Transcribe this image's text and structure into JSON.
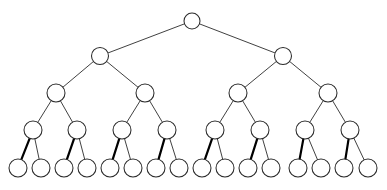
{
  "figure": {
    "type": "tree-diagram",
    "width": 387,
    "height": 190,
    "background_color": "#ffffff",
    "node_fill_color": "#ffffff",
    "node_stroke_color": "#2b2b2b",
    "edge_color": "#2b2b2b",
    "bold_edge_color": "#000000",
    "edge_width": 0.9,
    "bold_edge_width": 2.2,
    "node_stroke_width": 1.05,
    "depth": 5,
    "node_count": 31,
    "leaf_count": 16,
    "branching_factor": 2,
    "has_text_labels": false
  },
  "levels": [
    {
      "index": 0,
      "name": "root",
      "y": 21,
      "radius": 8.0,
      "count": 1
    },
    {
      "index": 1,
      "name": "level-1",
      "y": 56,
      "radius": 8.5,
      "count": 2
    },
    {
      "index": 2,
      "name": "level-2",
      "y": 93,
      "radius": 9.0,
      "count": 4
    },
    {
      "index": 3,
      "name": "level-3",
      "y": 130,
      "radius": 9.0,
      "count": 8
    },
    {
      "index": 4,
      "name": "leaves",
      "y": 168,
      "radius": 9.0,
      "count": 16
    }
  ],
  "nodes": [
    {
      "id": "n0",
      "level": 0,
      "x": 192.0,
      "y": 21,
      "r": 8.0
    },
    {
      "id": "n1",
      "level": 1,
      "x": 100.0,
      "y": 56,
      "r": 8.5
    },
    {
      "id": "n2",
      "level": 1,
      "x": 283.0,
      "y": 56,
      "r": 8.5
    },
    {
      "id": "n3",
      "level": 2,
      "x": 56.0,
      "y": 93,
      "r": 9.0
    },
    {
      "id": "n4",
      "level": 2,
      "x": 145.0,
      "y": 93,
      "r": 9.0
    },
    {
      "id": "n5",
      "level": 2,
      "x": 238.0,
      "y": 93,
      "r": 9.0
    },
    {
      "id": "n6",
      "level": 2,
      "x": 328.0,
      "y": 93,
      "r": 9.0
    },
    {
      "id": "n7",
      "level": 3,
      "x": 33.0,
      "y": 130,
      "r": 9.0
    },
    {
      "id": "n8",
      "level": 3,
      "x": 77.0,
      "y": 130,
      "r": 9.0
    },
    {
      "id": "n9",
      "level": 3,
      "x": 122.0,
      "y": 130,
      "r": 9.0
    },
    {
      "id": "n10",
      "level": 3,
      "x": 167.0,
      "y": 130,
      "r": 9.0
    },
    {
      "id": "n11",
      "level": 3,
      "x": 215.0,
      "y": 130,
      "r": 9.0
    },
    {
      "id": "n12",
      "level": 3,
      "x": 260.0,
      "y": 130,
      "r": 9.0
    },
    {
      "id": "n13",
      "level": 3,
      "x": 305.0,
      "y": 130,
      "r": 9.0
    },
    {
      "id": "n14",
      "level": 3,
      "x": 350.0,
      "y": 130,
      "r": 9.0
    },
    {
      "id": "n15",
      "level": 4,
      "x": 18.0,
      "y": 168,
      "r": 9.0
    },
    {
      "id": "n16",
      "level": 4,
      "x": 41.0,
      "y": 168,
      "r": 9.0
    },
    {
      "id": "n17",
      "level": 4,
      "x": 64.0,
      "y": 168,
      "r": 9.0
    },
    {
      "id": "n18",
      "level": 4,
      "x": 87.0,
      "y": 168,
      "r": 9.0
    },
    {
      "id": "n19",
      "level": 4,
      "x": 110.0,
      "y": 168,
      "r": 9.0
    },
    {
      "id": "n20",
      "level": 4,
      "x": 133.0,
      "y": 168,
      "r": 9.0
    },
    {
      "id": "n21",
      "level": 4,
      "x": 156.0,
      "y": 168,
      "r": 9.0
    },
    {
      "id": "n22",
      "level": 4,
      "x": 179.0,
      "y": 168,
      "r": 9.0
    },
    {
      "id": "n23",
      "level": 4,
      "x": 202.0,
      "y": 168,
      "r": 9.0
    },
    {
      "id": "n24",
      "level": 4,
      "x": 225.0,
      "y": 168,
      "r": 9.0
    },
    {
      "id": "n25",
      "level": 4,
      "x": 248.0,
      "y": 168,
      "r": 9.0
    },
    {
      "id": "n26",
      "level": 4,
      "x": 271.0,
      "y": 168,
      "r": 9.0
    },
    {
      "id": "n27",
      "level": 4,
      "x": 298.0,
      "y": 168,
      "r": 9.0
    },
    {
      "id": "n28",
      "level": 4,
      "x": 321.0,
      "y": 168,
      "r": 9.0
    },
    {
      "id": "n29",
      "level": 4,
      "x": 344.0,
      "y": 168,
      "r": 9.0
    },
    {
      "id": "n30",
      "level": 4,
      "x": 368.0,
      "y": 168,
      "r": 9.0
    }
  ],
  "edges": [
    {
      "from": "n0",
      "to": "n1",
      "bold": false
    },
    {
      "from": "n0",
      "to": "n2",
      "bold": false
    },
    {
      "from": "n1",
      "to": "n3",
      "bold": false
    },
    {
      "from": "n1",
      "to": "n4",
      "bold": false
    },
    {
      "from": "n2",
      "to": "n5",
      "bold": false
    },
    {
      "from": "n2",
      "to": "n6",
      "bold": false
    },
    {
      "from": "n3",
      "to": "n7",
      "bold": false
    },
    {
      "from": "n3",
      "to": "n8",
      "bold": false
    },
    {
      "from": "n4",
      "to": "n9",
      "bold": false
    },
    {
      "from": "n4",
      "to": "n10",
      "bold": false
    },
    {
      "from": "n5",
      "to": "n11",
      "bold": false
    },
    {
      "from": "n5",
      "to": "n12",
      "bold": false
    },
    {
      "from": "n6",
      "to": "n13",
      "bold": false
    },
    {
      "from": "n6",
      "to": "n14",
      "bold": false
    },
    {
      "from": "n7",
      "to": "n15",
      "bold": true
    },
    {
      "from": "n7",
      "to": "n16",
      "bold": false
    },
    {
      "from": "n8",
      "to": "n17",
      "bold": true
    },
    {
      "from": "n8",
      "to": "n18",
      "bold": false
    },
    {
      "from": "n9",
      "to": "n19",
      "bold": true
    },
    {
      "from": "n9",
      "to": "n20",
      "bold": false
    },
    {
      "from": "n10",
      "to": "n21",
      "bold": true
    },
    {
      "from": "n10",
      "to": "n22",
      "bold": false
    },
    {
      "from": "n11",
      "to": "n23",
      "bold": true
    },
    {
      "from": "n11",
      "to": "n24",
      "bold": false
    },
    {
      "from": "n12",
      "to": "n25",
      "bold": true
    },
    {
      "from": "n12",
      "to": "n26",
      "bold": false
    },
    {
      "from": "n13",
      "to": "n27",
      "bold": true
    },
    {
      "from": "n13",
      "to": "n28",
      "bold": false
    },
    {
      "from": "n14",
      "to": "n29",
      "bold": true
    },
    {
      "from": "n14",
      "to": "n30",
      "bold": false
    }
  ]
}
